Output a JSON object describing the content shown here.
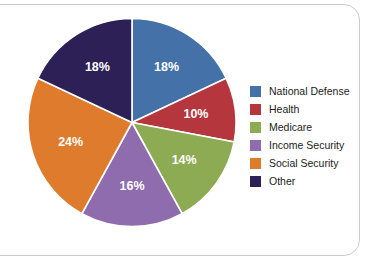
{
  "chart_data": {
    "type": "pie",
    "title": "",
    "categories": [
      "National Defense",
      "Health",
      "Medicare",
      "Income Security",
      "Social Security",
      "Other"
    ],
    "values": [
      18,
      10,
      14,
      16,
      24,
      18
    ],
    "value_labels": [
      "18%",
      "10%",
      "14%",
      "16%",
      "24%",
      "18%"
    ],
    "unit": "%",
    "total": 100,
    "start_angle_deg": 0,
    "direction": "clockwise",
    "legend_position": "right",
    "grid": false,
    "xlabel": "",
    "ylabel": "",
    "colors": [
      "#4472a8",
      "#b5363c",
      "#8cab52",
      "#8e6cad",
      "#de7b2c",
      "#2d2057"
    ],
    "slice_label_color": "#ffffff",
    "separator_color": "#ffffff",
    "background_color": "#ffffff"
  },
  "legend": {
    "items": [
      {
        "label": "National Defense",
        "color": "#4472a8",
        "value_label": "18%"
      },
      {
        "label": "Health",
        "color": "#b5363c",
        "value_label": "10%"
      },
      {
        "label": "Medicare",
        "color": "#8cab52",
        "value_label": "14%"
      },
      {
        "label": "Income Security",
        "color": "#8e6cad",
        "value_label": "16%"
      },
      {
        "label": "Social Security",
        "color": "#de7b2c",
        "value_label": "24%"
      },
      {
        "label": "Other",
        "color": "#2d2057",
        "value_label": "18%"
      }
    ]
  },
  "frame": {
    "border_color": "#c9c9d2"
  }
}
